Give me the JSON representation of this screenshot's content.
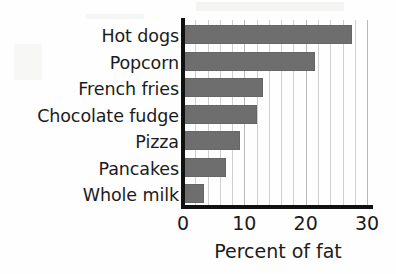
{
  "chart_data": {
    "type": "bar",
    "orientation": "horizontal",
    "title": "",
    "subtitle": "",
    "xlabel": "Percent of fat",
    "ylabel": "",
    "categories": [
      "Hot dogs",
      "Popcorn",
      "French fries",
      "Chocolate fudge",
      "Pizza",
      "Pancakes",
      "Whole milk"
    ],
    "values": [
      27.5,
      21.5,
      13,
      12,
      9.3,
      7,
      3.4
    ],
    "series": [
      {
        "name": "Percent of fat",
        "values": [
          27.5,
          21.5,
          13,
          12,
          9.3,
          7,
          3.4
        ]
      }
    ],
    "xlim": [
      0,
      30
    ],
    "xticks": [
      0,
      10,
      20,
      30
    ],
    "xtick_labels": [
      "0",
      "10",
      "20",
      "30"
    ],
    "gridlines": [
      0,
      2,
      4,
      6,
      8,
      10,
      12,
      14,
      16,
      18,
      20,
      22,
      24,
      26,
      28,
      30
    ],
    "grid": true,
    "grid_axis": "x",
    "legend": false,
    "legend_position": "none",
    "bar_color": "#6e6e6e",
    "axis_color": "#111111",
    "gridline_color": "#b9b9b9",
    "text_color": "#1b1b1b",
    "background_color": "#fefefe",
    "annotations": []
  },
  "axis_title": {
    "x": "Percent of fat"
  },
  "icons": {
    "none": ""
  }
}
